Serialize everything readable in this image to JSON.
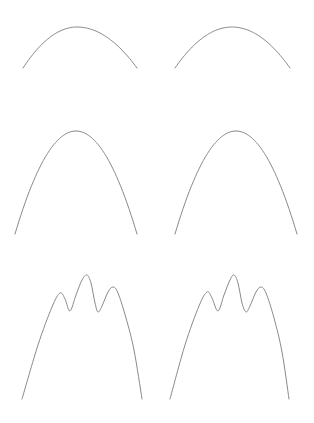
{
  "page": {
    "width": 314,
    "height": 423,
    "background": "#ffffff"
  },
  "style": {
    "line_color": "#8a8a8a",
    "line_width": 1
  },
  "chart_data": [
    {
      "type": "line",
      "title": "",
      "xlabel": "",
      "ylabel": "",
      "grid": false,
      "legend": null,
      "name": "row1-left parabola",
      "points": [
        [
          23,
          68
        ],
        [
          77,
          27
        ],
        [
          137,
          68
        ]
      ],
      "shape": "parabola"
    },
    {
      "type": "line",
      "title": "",
      "xlabel": "",
      "ylabel": "",
      "grid": false,
      "legend": null,
      "name": "row1-right parabola",
      "points": [
        [
          175,
          68
        ],
        [
          232,
          27
        ],
        [
          290,
          68
        ]
      ],
      "shape": "parabola"
    },
    {
      "type": "line",
      "title": "",
      "xlabel": "",
      "ylabel": "",
      "grid": false,
      "legend": null,
      "name": "row2-left parabola",
      "points": [
        [
          15,
          234
        ],
        [
          76,
          131
        ],
        [
          137,
          234
        ]
      ],
      "shape": "parabola"
    },
    {
      "type": "line",
      "title": "",
      "xlabel": "",
      "ylabel": "",
      "grid": false,
      "legend": null,
      "name": "row2-right parabola",
      "points": [
        [
          175,
          234
        ],
        [
          236,
          131
        ],
        [
          297,
          234
        ]
      ],
      "shape": "parabola"
    },
    {
      "type": "line",
      "title": "",
      "xlabel": "",
      "ylabel": "",
      "grid": false,
      "legend": null,
      "name": "row3-left three-peak curve",
      "points": [
        [
          22,
          399
        ],
        [
          38,
          345
        ],
        [
          52,
          307
        ],
        [
          60,
          293
        ],
        [
          65,
          299
        ],
        [
          70,
          311
        ],
        [
          76,
          295
        ],
        [
          82,
          280
        ],
        [
          87,
          275
        ],
        [
          91,
          283
        ],
        [
          95,
          303
        ],
        [
          98,
          312
        ],
        [
          102,
          306
        ],
        [
          108,
          292
        ],
        [
          113,
          287
        ],
        [
          118,
          293
        ],
        [
          126,
          318
        ],
        [
          134,
          350
        ],
        [
          142,
          399
        ]
      ],
      "shape": "multi-peak"
    },
    {
      "type": "line",
      "title": "",
      "xlabel": "",
      "ylabel": "",
      "grid": false,
      "legend": null,
      "name": "row3-right three-peak curve",
      "points": [
        [
          170,
          399
        ],
        [
          185,
          345
        ],
        [
          199,
          306
        ],
        [
          207,
          292
        ],
        [
          212,
          298
        ],
        [
          218,
          311
        ],
        [
          224,
          295
        ],
        [
          230,
          280
        ],
        [
          234,
          275
        ],
        [
          238,
          283
        ],
        [
          242,
          303
        ],
        [
          246,
          312
        ],
        [
          250,
          306
        ],
        [
          256,
          292
        ],
        [
          261,
          287
        ],
        [
          266,
          293
        ],
        [
          274,
          318
        ],
        [
          282,
          352
        ],
        [
          289,
          399
        ]
      ],
      "shape": "multi-peak"
    }
  ]
}
